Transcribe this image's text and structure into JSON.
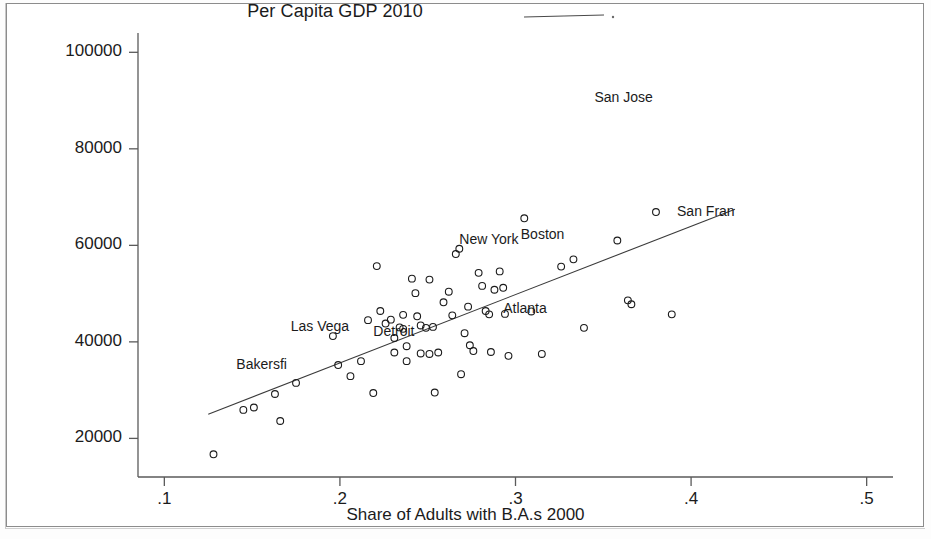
{
  "chart_data": {
    "type": "scatter",
    "title": "Per Capita GDP 2010",
    "xlabel": "Share of Adults with B.A.s 2000",
    "ylabel": "",
    "xlim": [
      0.085,
      0.515
    ],
    "ylim": [
      12000,
      104000
    ],
    "grid": false,
    "legend": {
      "position": "top-center",
      "entries": [
        {
          "label": "",
          "marker": "line-with-dot"
        }
      ]
    },
    "xticks": [
      ".1",
      ".2",
      ".3",
      ".4",
      ".5"
    ],
    "xtick_values": [
      0.1,
      0.2,
      0.3,
      0.4,
      0.5
    ],
    "yticks": [
      "20000",
      "40000",
      "60000",
      "80000",
      "100000"
    ],
    "ytick_values": [
      20000,
      40000,
      60000,
      80000,
      100000
    ],
    "marker": "open-circle",
    "marker_color": "#1b1b1b",
    "fit_line": {
      "type": "linear",
      "x_start": 0.125,
      "y_start": 25000,
      "x_end": 0.425,
      "y_end": 67500,
      "color": "#3b3b3b"
    },
    "annotations": [
      {
        "text": "San Jose",
        "x": 0.345,
        "y": 90500
      },
      {
        "text": "San Fran",
        "x": 0.392,
        "y": 66900
      },
      {
        "text": "New York",
        "x": 0.268,
        "y": 61200
      },
      {
        "text": "Boston",
        "x": 0.303,
        "y": 62100
      },
      {
        "text": "Atlanta",
        "x": 0.293,
        "y": 46900
      },
      {
        "text": "Las Vega",
        "x": 0.172,
        "y": 43100
      },
      {
        "text": "Detroit",
        "x": 0.219,
        "y": 42100
      },
      {
        "text": "Bakersfi",
        "x": 0.141,
        "y": 35200
      }
    ],
    "points": [
      {
        "x": 0.128,
        "y": 16700
      },
      {
        "x": 0.145,
        "y": 25900
      },
      {
        "x": 0.151,
        "y": 26400
      },
      {
        "x": 0.166,
        "y": 23600
      },
      {
        "x": 0.163,
        "y": 29200
      },
      {
        "x": 0.175,
        "y": 31500
      },
      {
        "x": 0.196,
        "y": 41200
      },
      {
        "x": 0.199,
        "y": 35200
      },
      {
        "x": 0.206,
        "y": 32900
      },
      {
        "x": 0.212,
        "y": 36000
      },
      {
        "x": 0.216,
        "y": 44500
      },
      {
        "x": 0.221,
        "y": 55700
      },
      {
        "x": 0.219,
        "y": 29400
      },
      {
        "x": 0.223,
        "y": 46400
      },
      {
        "x": 0.226,
        "y": 43800
      },
      {
        "x": 0.229,
        "y": 44600
      },
      {
        "x": 0.231,
        "y": 40800
      },
      {
        "x": 0.231,
        "y": 37800
      },
      {
        "x": 0.234,
        "y": 43000
      },
      {
        "x": 0.236,
        "y": 45600
      },
      {
        "x": 0.236,
        "y": 42700
      },
      {
        "x": 0.238,
        "y": 39100
      },
      {
        "x": 0.238,
        "y": 36000
      },
      {
        "x": 0.241,
        "y": 53100
      },
      {
        "x": 0.243,
        "y": 50100
      },
      {
        "x": 0.244,
        "y": 45300
      },
      {
        "x": 0.246,
        "y": 43400
      },
      {
        "x": 0.246,
        "y": 37600
      },
      {
        "x": 0.249,
        "y": 42900
      },
      {
        "x": 0.251,
        "y": 52900
      },
      {
        "x": 0.251,
        "y": 37500
      },
      {
        "x": 0.253,
        "y": 43100
      },
      {
        "x": 0.254,
        "y": 29500
      },
      {
        "x": 0.256,
        "y": 37800
      },
      {
        "x": 0.259,
        "y": 48200
      },
      {
        "x": 0.262,
        "y": 50400
      },
      {
        "x": 0.264,
        "y": 45500
      },
      {
        "x": 0.266,
        "y": 58200
      },
      {
        "x": 0.268,
        "y": 59300
      },
      {
        "x": 0.269,
        "y": 33300
      },
      {
        "x": 0.271,
        "y": 41800
      },
      {
        "x": 0.273,
        "y": 47300
      },
      {
        "x": 0.274,
        "y": 39300
      },
      {
        "x": 0.276,
        "y": 38100
      },
      {
        "x": 0.279,
        "y": 54300
      },
      {
        "x": 0.281,
        "y": 51600
      },
      {
        "x": 0.283,
        "y": 46400
      },
      {
        "x": 0.285,
        "y": 45700
      },
      {
        "x": 0.286,
        "y": 37900
      },
      {
        "x": 0.288,
        "y": 50800
      },
      {
        "x": 0.291,
        "y": 54600
      },
      {
        "x": 0.293,
        "y": 51200
      },
      {
        "x": 0.294,
        "y": 45800
      },
      {
        "x": 0.296,
        "y": 37100
      },
      {
        "x": 0.305,
        "y": 65600
      },
      {
        "x": 0.309,
        "y": 46300
      },
      {
        "x": 0.315,
        "y": 37500
      },
      {
        "x": 0.326,
        "y": 55600
      },
      {
        "x": 0.333,
        "y": 57100
      },
      {
        "x": 0.339,
        "y": 42900
      },
      {
        "x": 0.358,
        "y": 61000
      },
      {
        "x": 0.364,
        "y": 48600
      },
      {
        "x": 0.366,
        "y": 47800
      },
      {
        "x": 0.38,
        "y": 66900
      },
      {
        "x": 0.389,
        "y": 45700
      }
    ]
  },
  "layout": {
    "plot_left_px": 138,
    "plot_right_px": 893,
    "plot_top_px": 33,
    "plot_bottom_px": 477
  }
}
